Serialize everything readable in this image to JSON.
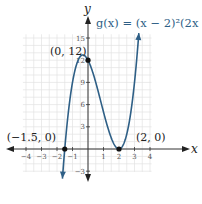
{
  "chart_data": {
    "type": "line",
    "title": "g(x) = (x − 2)²(2x + 3)",
    "function": "(x-2)^2*(2x+3)",
    "xlabel": "x",
    "ylabel": "y",
    "xlim": [
      -4.2,
      4.1
    ],
    "ylim": [
      -3.1,
      15.5
    ],
    "grid": true,
    "x_ticks": [
      -4,
      -3,
      -2,
      -1,
      1,
      2,
      3,
      4
    ],
    "x_tick_labels": [
      "−4",
      "−3",
      "−2",
      "−1",
      "1",
      "2",
      "3",
      "4"
    ],
    "y_ticks": [
      -3,
      3,
      6,
      9,
      12,
      15
    ],
    "y_tick_labels": [
      "−3",
      "3",
      "6",
      "9",
      "12",
      "15"
    ],
    "curve_domain": [
      -1.65,
      3.28
    ],
    "series": [
      {
        "name": "g(x)",
        "color": "#2e5f86",
        "x": [
          -1.65,
          -1.5,
          -1.0,
          -0.5,
          0,
          0.5,
          1.0,
          1.5,
          2.0,
          2.5,
          3.0,
          3.28
        ],
        "y": [
          -3.99,
          0,
          9,
          12.5,
          12,
          9,
          5,
          1.5,
          0,
          2,
          9,
          15.9
        ]
      }
    ],
    "points": [
      {
        "x": 0,
        "y": 12,
        "label": "(0, 12)"
      },
      {
        "x": -1.5,
        "y": 0,
        "label": "(−1.5, 0)"
      },
      {
        "x": 2,
        "y": 0,
        "label": "(2, 0)"
      }
    ]
  }
}
